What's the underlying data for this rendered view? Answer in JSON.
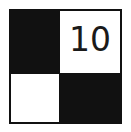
{
  "puzzle": {
    "rows": 2,
    "cols": 2,
    "cells": [
      {
        "row": 0,
        "col": 0,
        "color": "black",
        "value": ""
      },
      {
        "row": 0,
        "col": 1,
        "color": "white",
        "value": "10"
      },
      {
        "row": 1,
        "col": 0,
        "color": "white",
        "value": ""
      },
      {
        "row": 1,
        "col": 1,
        "color": "black",
        "value": ""
      }
    ]
  },
  "colors": {
    "black": "#111111",
    "white": "#ffffff"
  }
}
